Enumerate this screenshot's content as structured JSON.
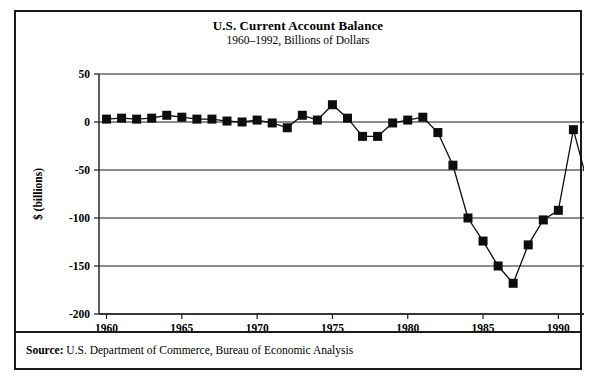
{
  "figure": {
    "title": "U.S. Current Account Balance",
    "subtitle": "1960–1992, Billions of Dollars",
    "source_label": "Source:",
    "source_text": " U.S. Department of Commerce, Bureau of Economic Analysis",
    "frame_color": "#1a1a1a"
  },
  "chart_data": {
    "type": "line",
    "title": "U.S. Current Account Balance",
    "subtitle": "1960–1992, Billions of Dollars",
    "xlabel": "Year",
    "ylabel": "$ (billions)",
    "xlim": [
      1959.5,
      1992.5
    ],
    "ylim": [
      -200,
      50
    ],
    "grid": true,
    "legend": "none",
    "marker": "square",
    "series_color": "#0d0d0d",
    "x_ticks": [
      1960,
      1965,
      1970,
      1975,
      1980,
      1985,
      1990
    ],
    "y_ticks": [
      50,
      0,
      -50,
      -100,
      -150,
      -200
    ],
    "x": [
      1960,
      1961,
      1962,
      1963,
      1964,
      1965,
      1966,
      1967,
      1968,
      1969,
      1970,
      1971,
      1972,
      1973,
      1974,
      1975,
      1976,
      1977,
      1978,
      1979,
      1980,
      1981,
      1982,
      1983,
      1984,
      1985,
      1986,
      1987,
      1988,
      1989,
      1990,
      1991,
      1992
    ],
    "values": [
      3,
      4,
      3,
      4,
      7,
      5,
      3,
      3,
      1,
      0,
      2,
      -1,
      -6,
      7,
      2,
      18,
      4,
      -15,
      -15,
      -1,
      2,
      5,
      -11,
      -45,
      -100,
      -124,
      -150,
      -168,
      -128,
      -102,
      -92,
      -8,
      -67
    ],
    "series": [
      {
        "name": "U.S. Current Account Balance",
        "values": [
          3,
          4,
          3,
          4,
          7,
          5,
          3,
          3,
          1,
          0,
          2,
          -1,
          -6,
          7,
          2,
          18,
          4,
          -15,
          -15,
          -1,
          2,
          5,
          -11,
          -45,
          -100,
          -124,
          -150,
          -168,
          -128,
          -102,
          -92,
          -8,
          -67
        ]
      }
    ]
  },
  "plot_geometry": {
    "left": 83,
    "right": 580,
    "top": 62,
    "bottom": 302,
    "marker_size": 9
  }
}
